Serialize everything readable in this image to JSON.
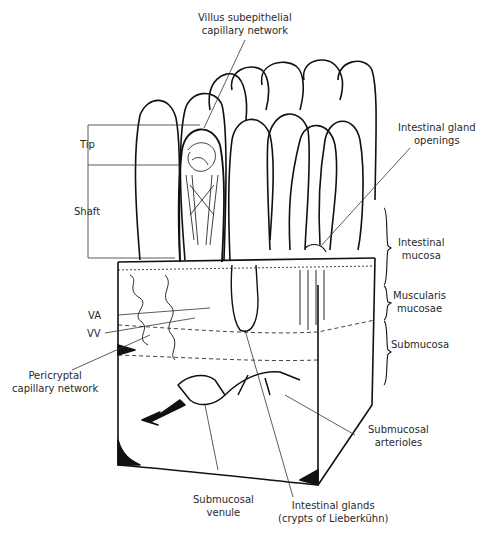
{
  "figure": {
    "labels": {
      "villus_capillary": [
        "Villus subepithelial",
        "capillary network"
      ],
      "gland_openings": [
        "Intestinal gland",
        "openings"
      ],
      "tip": "Tip",
      "shaft": "Shaft",
      "intestinal_mucosa": [
        "Intestinal",
        "mucosa"
      ],
      "muscularis_mucosae": [
        "Muscularis",
        "mucosae"
      ],
      "submucosa": "Submucosa",
      "va": "VA",
      "vv": "VV",
      "pericryptal": [
        "Pericryptal",
        "capillary network"
      ],
      "submucosal_arterioles": [
        "Submucosal",
        "arterioles"
      ],
      "submucosal_venule": [
        "Submucosal",
        "venule"
      ],
      "intestinal_glands": [
        "Intestinal glands",
        "(crypts of Lieberkühn)"
      ]
    },
    "colors": {
      "ink": "#111111",
      "leader": "#333333",
      "text": "#2a2a2a"
    }
  }
}
